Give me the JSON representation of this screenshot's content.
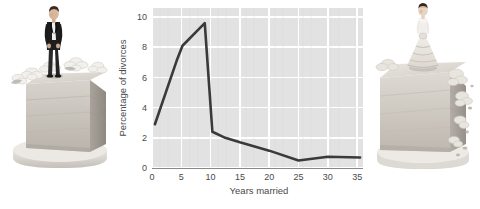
{
  "figure": {
    "name": "divorce-rate-by-years-married-figure",
    "background_color": "#ffffff"
  },
  "left_image": {
    "name": "groom-cake-slice-photo",
    "alt": "Slice of white wedding cake with a groom figurine in a black tuxedo standing on top, surrounded by white sugar flowers",
    "subject": "groom-figurine-on-cake"
  },
  "right_image": {
    "name": "bride-cake-slice-photo",
    "alt": "Slice of white wedding cake with a bride figurine in a white gown on top, with crumbling frosting flowers",
    "subject": "bride-figurine-on-cake"
  },
  "chart_data": {
    "type": "line",
    "title": "",
    "xlabel": "Years married",
    "ylabel": "Percentage of divorces",
    "xlim": [
      0,
      36
    ],
    "ylim": [
      0,
      10.6
    ],
    "grid": true,
    "legend": false,
    "legend_position": "none",
    "plot_background_color": "#e2e2e2",
    "gridline_color": "#ffffff",
    "line_color": "#3a3a3a",
    "line_width": 2.6,
    "xticks": [
      0,
      5,
      10,
      15,
      20,
      25,
      30,
      35
    ],
    "xticklabels": [
      "0",
      "5",
      "10",
      "15",
      "20",
      "25",
      "30",
      "35"
    ],
    "yticks": [
      0,
      2,
      4,
      6,
      8,
      10
    ],
    "yticklabels": [
      "0",
      "2",
      "4",
      "6",
      "8",
      "10"
    ],
    "x": [
      0.5,
      4.2,
      5.2,
      9.0,
      10.3,
      12.5,
      15.0,
      20.0,
      25.0,
      30.0,
      35.5
    ],
    "values": [
      2.9,
      7.1,
      8.1,
      9.6,
      2.4,
      2.0,
      1.7,
      1.15,
      0.5,
      0.75,
      0.7
    ],
    "series": [
      {
        "name": "Percentage of divorces",
        "x": [
          0.5,
          4.2,
          5.2,
          9.0,
          10.3,
          12.5,
          15.0,
          20.0,
          25.0,
          30.0,
          35.5
        ],
        "values": [
          2.9,
          7.1,
          8.1,
          9.6,
          2.4,
          2.0,
          1.7,
          1.15,
          0.5,
          0.75,
          0.7
        ]
      }
    ],
    "annotations": []
  }
}
